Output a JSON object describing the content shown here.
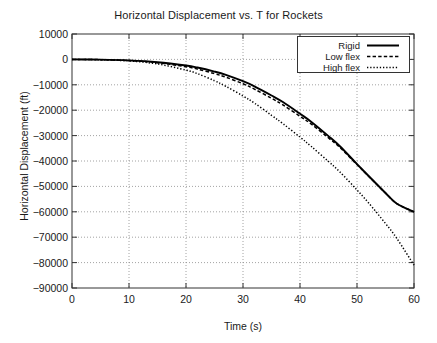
{
  "chart_data": {
    "type": "line",
    "title": "Horizontal Displacement vs. T for Rockets",
    "xlabel": "Time (s)",
    "ylabel": "Horizontal Displacement (ft)",
    "xlim": [
      0,
      60
    ],
    "ylim": [
      -90000,
      10000
    ],
    "xticks": [
      0,
      10,
      20,
      30,
      40,
      50,
      60
    ],
    "yticks": [
      10000,
      0,
      -10000,
      -20000,
      -30000,
      -40000,
      -50000,
      -60000,
      -70000,
      -80000,
      -90000
    ],
    "xtick_labels": [
      "0",
      "10",
      "20",
      "30",
      "40",
      "50",
      "60"
    ],
    "ytick_labels": [
      "10000",
      "0",
      "-10000",
      "-20000",
      "-30000",
      "-40000",
      "-50000",
      "-60000",
      "-70000",
      "-80000",
      "-90000"
    ],
    "grid": true,
    "legend_position": "upper right",
    "x": [
      0,
      5,
      10,
      15,
      20,
      22,
      25,
      27,
      30,
      32,
      35,
      37,
      40,
      42,
      45,
      47,
      50,
      52,
      55,
      57,
      60
    ],
    "series": [
      {
        "name": "Rigid",
        "style": "solid",
        "color": "#000000",
        "values": [
          0,
          -100,
          -400,
          -1100,
          -2400,
          -3200,
          -4800,
          -6100,
          -8600,
          -10600,
          -14200,
          -16800,
          -21400,
          -24600,
          -30200,
          -34200,
          -41200,
          -45800,
          -52600,
          -56800,
          -60000
        ]
      },
      {
        "name": "Low flex",
        "style": "dashed",
        "color": "#000000",
        "values": [
          0,
          -100,
          -450,
          -1300,
          -2900,
          -3800,
          -5600,
          -7000,
          -9600,
          -11700,
          -15300,
          -17900,
          -22400,
          -25500,
          -30900,
          -34700,
          -41400,
          -45900,
          -52600,
          -56800,
          -60000
        ]
      },
      {
        "name": "High flex",
        "style": "dotted",
        "color": "#000000",
        "values": [
          0,
          -150,
          -600,
          -1800,
          -4200,
          -5600,
          -8400,
          -10600,
          -14400,
          -17200,
          -22000,
          -25300,
          -30600,
          -34300,
          -40200,
          -44300,
          -51400,
          -56400,
          -64600,
          -70500,
          -81000
        ]
      }
    ]
  }
}
